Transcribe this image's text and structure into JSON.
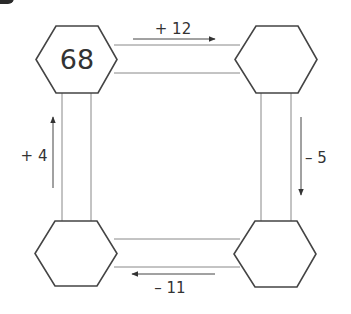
{
  "puzzle": {
    "nodes": [
      {
        "id": "top-left",
        "value": "68"
      },
      {
        "id": "top-right",
        "value": ""
      },
      {
        "id": "bottom-right",
        "value": ""
      },
      {
        "id": "bottom-left",
        "value": ""
      }
    ],
    "operations": {
      "top": {
        "label": "+ 12",
        "direction": "right"
      },
      "right": {
        "label": "– 5",
        "direction": "down"
      },
      "bottom": {
        "label": "– 11",
        "direction": "left"
      },
      "left": {
        "label": "+ 4",
        "direction": "up"
      }
    }
  },
  "colors": {
    "stroke": "#444444",
    "connector": "#777777",
    "text": "#333333"
  }
}
